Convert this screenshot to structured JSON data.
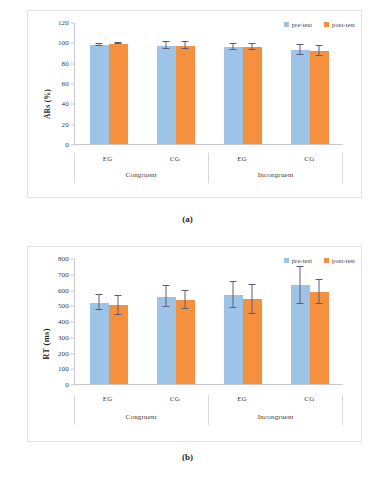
{
  "figure": {
    "panel_a_caption": "(a)",
    "panel_b_caption": "(b)"
  },
  "legend": {
    "pre_label": "pre-test",
    "post_label": "post-test",
    "pre_color": "#9DC3E6",
    "post_color": "#F4903E"
  },
  "axis_labels": {
    "group_eg": "EG",
    "group_cg": "CG",
    "cond_congruent": "Congruent",
    "cond_incongruent": "Incongruent"
  },
  "chart_data": [
    {
      "type": "bar",
      "title": "(a)",
      "xlabel": "",
      "ylabel": "ARs (%)",
      "ylim": [
        0,
        120
      ],
      "yticks": [
        0,
        20,
        40,
        60,
        80,
        100,
        120
      ],
      "grid": false,
      "legend_position": "top-right",
      "categories": [
        "EG",
        "CG",
        "EG",
        "CG"
      ],
      "supercategories": [
        "Congruent",
        "Incongruent"
      ],
      "series": [
        {
          "name": "pre-test",
          "color": "#9DC3E6",
          "values": [
            98.5,
            97.5,
            96.5,
            93.0
          ],
          "errors": [
            1.0,
            3.5,
            3.0,
            5.0
          ]
        },
        {
          "name": "post-test",
          "color": "#F4903E",
          "values": [
            99.5,
            97.5,
            96.0,
            92.5
          ],
          "errors": [
            0.6,
            3.5,
            3.0,
            5.0
          ]
        }
      ]
    },
    {
      "type": "bar",
      "title": "(b)",
      "xlabel": "",
      "ylabel": "RT (ms)",
      "ylim": [
        0,
        800
      ],
      "yticks": [
        0,
        100,
        200,
        300,
        400,
        500,
        600,
        700,
        800
      ],
      "grid": false,
      "legend_position": "top-right",
      "categories": [
        "EG",
        "CG",
        "EG",
        "CG"
      ],
      "supercategories": [
        "Congruent",
        "Incongruent"
      ],
      "series": [
        {
          "name": "pre-test",
          "color": "#9DC3E6",
          "values": [
            520,
            558,
            570,
            632
          ],
          "errors": [
            48,
            68,
            83,
            117
          ]
        },
        {
          "name": "post-test",
          "color": "#F4903E",
          "values": [
            503,
            538,
            542,
            590
          ],
          "errors": [
            62,
            60,
            92,
            75
          ]
        }
      ]
    }
  ],
  "yticks_a": [
    "120",
    "100",
    "80",
    "60",
    "40",
    "20",
    "0"
  ],
  "yticks_b": [
    "800",
    "700",
    "600",
    "500",
    "400",
    "300",
    "200",
    "100",
    "0"
  ]
}
